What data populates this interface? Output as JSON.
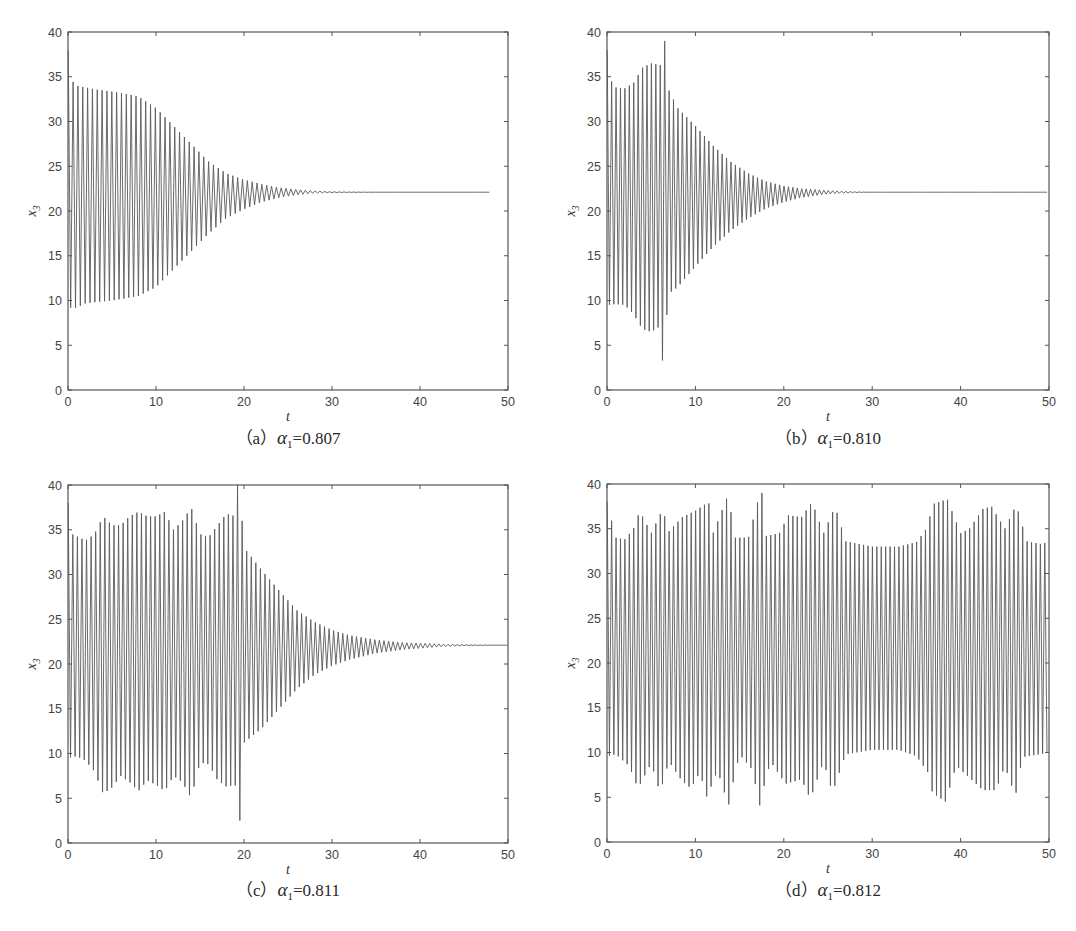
{
  "figure": {
    "panels": [
      {
        "id": "a",
        "caption_prefix": "（a）",
        "param_symbol": "α",
        "param_sub": "1",
        "param_value": "=0.807"
      },
      {
        "id": "b",
        "caption_prefix": "（b）",
        "param_symbol": "α",
        "param_sub": "1",
        "param_value": "=0.810"
      },
      {
        "id": "c",
        "caption_prefix": "（c）",
        "param_symbol": "α",
        "param_sub": "1",
        "param_value": "=0.811"
      },
      {
        "id": "d",
        "caption_prefix": "（d）",
        "param_symbol": "α",
        "param_sub": "1",
        "param_value": "=0.812"
      }
    ]
  },
  "chart_data": [
    {
      "type": "line",
      "title": "(a) α1=0.807",
      "xlabel": "t",
      "ylabel": "x3",
      "xlim": [
        0,
        50
      ],
      "ylim": [
        0,
        40
      ],
      "xticks": [
        0,
        10,
        20,
        30,
        40,
        50
      ],
      "yticks": [
        0,
        5,
        10,
        15,
        20,
        25,
        30,
        35,
        40
      ],
      "grid": false,
      "description": "Damped oscillation converging to equilibrium ~22.1; signal plotted up to t≈48",
      "t_end": 48,
      "period": 0.55,
      "equilibrium": 22.1,
      "start_value": 38,
      "envelope_upper": [
        [
          0,
          38
        ],
        [
          0.5,
          34.5
        ],
        [
          1,
          34
        ],
        [
          3,
          33.6
        ],
        [
          6,
          33.2
        ],
        [
          8,
          32.8
        ],
        [
          10,
          31.5
        ],
        [
          12,
          29.5
        ],
        [
          14,
          27.5
        ],
        [
          16,
          25.5
        ],
        [
          18,
          24.2
        ],
        [
          20,
          23.5
        ],
        [
          22,
          23
        ],
        [
          24,
          22.6
        ],
        [
          26,
          22.4
        ],
        [
          28,
          22.25
        ],
        [
          30,
          22.15
        ],
        [
          35,
          22.1
        ],
        [
          48,
          22.1
        ]
      ],
      "envelope_lower": [
        [
          0,
          9.5
        ],
        [
          0.5,
          9
        ],
        [
          2,
          9.7
        ],
        [
          5,
          10
        ],
        [
          8,
          10.5
        ],
        [
          10,
          11.5
        ],
        [
          12,
          13.5
        ],
        [
          14,
          15.5
        ],
        [
          16,
          17.5
        ],
        [
          18,
          19.2
        ],
        [
          20,
          20.2
        ],
        [
          22,
          21
        ],
        [
          24,
          21.5
        ],
        [
          26,
          21.8
        ],
        [
          28,
          22
        ],
        [
          30,
          22.05
        ],
        [
          35,
          22.1
        ],
        [
          48,
          22.1
        ]
      ],
      "notable_points": []
    },
    {
      "type": "line",
      "title": "(b) α1=0.810",
      "xlabel": "t",
      "ylabel": "x3",
      "xlim": [
        0,
        50
      ],
      "ylim": [
        0,
        40
      ],
      "xticks": [
        0,
        10,
        20,
        30,
        40,
        50
      ],
      "yticks": [
        0,
        5,
        10,
        15,
        20,
        25,
        30,
        35,
        40
      ],
      "grid": false,
      "description": "Irregular transient with max ~39 and min ~3.3 near t≈6.3, then decays to ~22.1",
      "t_end": 50,
      "period": 0.5,
      "equilibrium": 22.1,
      "start_value": 38,
      "envelope_upper": [
        [
          0,
          38
        ],
        [
          0.5,
          34.5
        ],
        [
          1,
          33.8
        ],
        [
          2,
          33.7
        ],
        [
          3,
          34.3
        ],
        [
          4,
          36
        ],
        [
          5,
          36.5
        ],
        [
          6,
          36.3
        ],
        [
          6.5,
          36.2
        ],
        [
          7,
          33.5
        ],
        [
          8,
          31.5
        ],
        [
          10,
          29.5
        ],
        [
          12,
          27.3
        ],
        [
          14,
          25.5
        ],
        [
          16,
          24.2
        ],
        [
          18,
          23.3
        ],
        [
          20,
          22.8
        ],
        [
          22,
          22.5
        ],
        [
          25,
          22.3
        ],
        [
          28,
          22.15
        ],
        [
          30,
          22.1
        ],
        [
          50,
          22.1
        ]
      ],
      "envelope_lower": [
        [
          0,
          9.5
        ],
        [
          1,
          9.6
        ],
        [
          2,
          9.5
        ],
        [
          3,
          8.5
        ],
        [
          4,
          6.8
        ],
        [
          5,
          6.5
        ],
        [
          5.8,
          7
        ],
        [
          6.3,
          3.3
        ],
        [
          7,
          10.8
        ],
        [
          8,
          11.5
        ],
        [
          10,
          13.8
        ],
        [
          12,
          16
        ],
        [
          14,
          17.8
        ],
        [
          16,
          19.2
        ],
        [
          18,
          20.3
        ],
        [
          20,
          21
        ],
        [
          22,
          21.5
        ],
        [
          25,
          21.9
        ],
        [
          28,
          22.05
        ],
        [
          30,
          22.1
        ],
        [
          50,
          22.1
        ]
      ],
      "notable_points": [
        {
          "t": 6.3,
          "x3": 39.0,
          "label": "max spike"
        },
        {
          "t": 6.2,
          "x3": 3.3,
          "label": "min dip"
        }
      ]
    },
    {
      "type": "line",
      "title": "(c) α1=0.811",
      "xlabel": "t",
      "ylabel": "x3",
      "xlim": [
        0,
        50
      ],
      "ylim": [
        0,
        40
      ],
      "xticks": [
        0,
        10,
        20,
        30,
        40,
        50
      ],
      "yticks": [
        0,
        5,
        10,
        15,
        20,
        25,
        30,
        35,
        40
      ],
      "grid": false,
      "description": "Irregular bursting until t≈19.5 (spike to 40, dip to ~2.5), then decays to ~22.1",
      "t_end": 50,
      "period": 0.52,
      "equilibrium": 22.1,
      "start_value": 38,
      "envelope_upper": [
        [
          0,
          38
        ],
        [
          0.5,
          34.5
        ],
        [
          2,
          33.8
        ],
        [
          3,
          34.5
        ],
        [
          4,
          36.5
        ],
        [
          5,
          35.5
        ],
        [
          6,
          35.5
        ],
        [
          7,
          36.5
        ],
        [
          8,
          37
        ],
        [
          9,
          36.5
        ],
        [
          10,
          36.5
        ],
        [
          11,
          37
        ],
        [
          12,
          35
        ],
        [
          13,
          36
        ],
        [
          14,
          37.5
        ],
        [
          15,
          34.5
        ],
        [
          16,
          34.2
        ],
        [
          17,
          35.5
        ],
        [
          18,
          36.8
        ],
        [
          19,
          36.5
        ],
        [
          19.5,
          40
        ],
        [
          20,
          33
        ],
        [
          22,
          30.5
        ],
        [
          24,
          28.2
        ],
        [
          26,
          26
        ],
        [
          28,
          24.7
        ],
        [
          30,
          23.8
        ],
        [
          32,
          23.2
        ],
        [
          35,
          22.7
        ],
        [
          38,
          22.4
        ],
        [
          42,
          22.25
        ],
        [
          45,
          22.15
        ],
        [
          50,
          22.1
        ]
      ],
      "envelope_lower": [
        [
          0,
          9.5
        ],
        [
          1,
          9.7
        ],
        [
          2,
          9.2
        ],
        [
          3,
          8
        ],
        [
          4,
          5.5
        ],
        [
          5,
          6.2
        ],
        [
          6,
          7.5
        ],
        [
          7,
          6.8
        ],
        [
          8,
          5.8
        ],
        [
          9,
          7
        ],
        [
          10,
          6.5
        ],
        [
          11,
          5.8
        ],
        [
          12,
          7.5
        ],
        [
          13,
          6.8
        ],
        [
          14,
          5
        ],
        [
          15,
          9
        ],
        [
          16,
          8.8
        ],
        [
          17,
          7
        ],
        [
          18,
          6.3
        ],
        [
          19,
          6.5
        ],
        [
          19.3,
          2.5
        ],
        [
          20,
          11.2
        ],
        [
          22,
          12.8
        ],
        [
          24,
          15
        ],
        [
          26,
          17.2
        ],
        [
          28,
          18.8
        ],
        [
          30,
          19.8
        ],
        [
          32,
          20.5
        ],
        [
          35,
          21.2
        ],
        [
          38,
          21.6
        ],
        [
          42,
          21.9
        ],
        [
          45,
          22.05
        ],
        [
          50,
          22.1
        ]
      ],
      "notable_points": [
        {
          "t": 19.5,
          "x3": 40.0,
          "label": "max spike"
        },
        {
          "t": 19.3,
          "x3": 2.5,
          "label": "min dip"
        }
      ]
    },
    {
      "type": "line",
      "title": "(d) α1=0.812",
      "xlabel": "t",
      "ylabel": "x3",
      "xlim": [
        0,
        50
      ],
      "ylim": [
        0,
        40
      ],
      "xticks": [
        0,
        10,
        20,
        30,
        40,
        50
      ],
      "yticks": [
        0,
        5,
        10,
        15,
        20,
        25,
        30,
        35,
        40
      ],
      "grid": false,
      "description": "Sustained irregular (chaotic-like) oscillation between ~4 and ~39 for entire interval",
      "t_end": 50,
      "period": 0.5,
      "equilibrium": 22.1,
      "start_value": 38,
      "envelope_upper": [
        [
          0,
          38
        ],
        [
          1,
          34
        ],
        [
          2,
          33.8
        ],
        [
          3,
          35
        ],
        [
          3.7,
          37
        ],
        [
          5,
          34.5
        ],
        [
          6.3,
          37.2
        ],
        [
          7,
          34.7
        ],
        [
          8.5,
          36.3
        ],
        [
          10,
          37
        ],
        [
          11.5,
          38
        ],
        [
          12,
          34.5
        ],
        [
          13.7,
          38.8
        ],
        [
          14.5,
          34
        ],
        [
          16,
          34
        ],
        [
          17.3,
          39
        ],
        [
          18,
          34.2
        ],
        [
          19.5,
          34.5
        ],
        [
          20.5,
          36.5
        ],
        [
          22,
          36.3
        ],
        [
          23.2,
          38
        ],
        [
          24.5,
          34.5
        ],
        [
          25.8,
          37.5
        ],
        [
          27,
          33.6
        ],
        [
          30,
          33
        ],
        [
          33,
          33
        ],
        [
          35,
          33.5
        ],
        [
          36,
          34.8
        ],
        [
          37,
          37.8
        ],
        [
          38.5,
          38.3
        ],
        [
          40,
          34.5
        ],
        [
          41,
          35
        ],
        [
          42.5,
          37.2
        ],
        [
          43.5,
          37.5
        ],
        [
          45,
          35
        ],
        [
          46.3,
          37.7
        ],
        [
          47.5,
          33.6
        ],
        [
          49,
          33.3
        ],
        [
          50,
          33.5
        ]
      ],
      "envelope_lower": [
        [
          0,
          9.6
        ],
        [
          1,
          9.8
        ],
        [
          2.5,
          8.5
        ],
        [
          3.5,
          6
        ],
        [
          5,
          8.8
        ],
        [
          6,
          5.5
        ],
        [
          7,
          9
        ],
        [
          8.5,
          6.8
        ],
        [
          9.5,
          6
        ],
        [
          10.5,
          7.8
        ],
        [
          11.3,
          5
        ],
        [
          12.5,
          8
        ],
        [
          13.7,
          4.2
        ],
        [
          15,
          9.8
        ],
        [
          16.5,
          8
        ],
        [
          17.2,
          4.1
        ],
        [
          18.5,
          9
        ],
        [
          20.2,
          6.5
        ],
        [
          22,
          7
        ],
        [
          23,
          4.8
        ],
        [
          24.5,
          9
        ],
        [
          25.5,
          5.5
        ],
        [
          27,
          9.8
        ],
        [
          30,
          10.3
        ],
        [
          33,
          10.3
        ],
        [
          35,
          9.6
        ],
        [
          36.5,
          7.5
        ],
        [
          36.8,
          5.5
        ],
        [
          38.3,
          4.5
        ],
        [
          39.5,
          8.5
        ],
        [
          41,
          7.2
        ],
        [
          42.5,
          5.8
        ],
        [
          44,
          5.8
        ],
        [
          45,
          8.5
        ],
        [
          46.2,
          5.1
        ],
        [
          47,
          9.5
        ],
        [
          49,
          9.8
        ],
        [
          50,
          10
        ]
      ],
      "notable_points": [
        {
          "t": 17.3,
          "x3": 39.0,
          "label": "max spike"
        },
        {
          "t": 13.7,
          "x3": 4.2,
          "label": "deep dip"
        },
        {
          "t": 17.2,
          "x3": 4.1,
          "label": "deepest dip"
        }
      ]
    }
  ]
}
